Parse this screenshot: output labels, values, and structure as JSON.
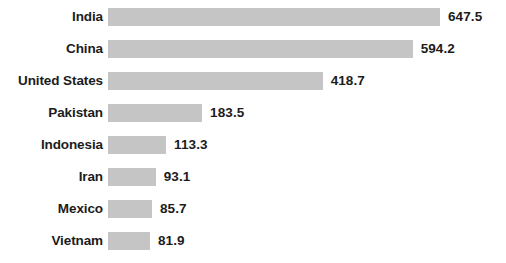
{
  "chart_data": {
    "type": "bar",
    "orientation": "horizontal",
    "title": "",
    "subtitle": "",
    "xlabel": "",
    "ylabel": "",
    "categories": [
      "India",
      "China",
      "United States",
      "Pakistan",
      "Indonesia",
      "Iran",
      "Mexico",
      "Vietnam"
    ],
    "values": [
      647.5,
      594.2,
      418.7,
      183.5,
      113.3,
      93.1,
      85.7,
      81.9
    ],
    "value_labels": [
      "647.5",
      "594.2",
      "418.7",
      "183.5",
      "113.3",
      "93.1",
      "85.7",
      "81.9"
    ],
    "series": [
      {
        "name": "",
        "values": [
          647.5,
          594.2,
          418.7,
          183.5,
          113.3,
          93.1,
          85.7,
          81.9
        ]
      }
    ],
    "xlim": [
      0,
      647.5
    ],
    "grid": false,
    "legend": false,
    "legend_position": "none",
    "axis_visible": false,
    "tick_labels": [],
    "annotations": [],
    "bar_color": "#c5c5c5",
    "label_color": "#1c1c1c",
    "background_color": "#ffffff",
    "bars": [
      {
        "category": "India",
        "value": 647.5,
        "label": "647.5"
      },
      {
        "category": "China",
        "value": 594.2,
        "label": "594.2"
      },
      {
        "category": "United States",
        "value": 418.7,
        "label": "418.7"
      },
      {
        "category": "Pakistan",
        "value": 183.5,
        "label": "183.5"
      },
      {
        "category": "Indonesia",
        "value": 113.3,
        "label": "113.3"
      },
      {
        "category": "Iran",
        "value": 93.1,
        "label": "93.1"
      },
      {
        "category": "Mexico",
        "value": 85.7,
        "label": "85.7"
      },
      {
        "category": "Vietnam",
        "value": 81.9,
        "label": "81.9"
      }
    ]
  },
  "layout": {
    "bar_origin_x": 108,
    "bar_height": 18,
    "row_pitch": 32,
    "first_row_top": 8,
    "px_per_unit": 0.5127,
    "value_gap": 8
  }
}
